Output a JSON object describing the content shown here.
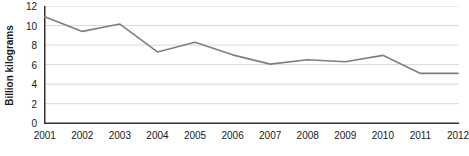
{
  "chart_data": {
    "type": "line",
    "title": "",
    "xlabel": "",
    "ylabel": "Billion kilograms",
    "categories": [
      "2001",
      "2002",
      "2003",
      "2004",
      "2005",
      "2006",
      "2007",
      "2008",
      "2009",
      "2010",
      "2011",
      "2012"
    ],
    "values": [
      10.9,
      9.4,
      10.15,
      7.3,
      8.3,
      7.0,
      6.05,
      6.5,
      6.3,
      6.95,
      5.1,
      5.1
    ],
    "series": [
      {
        "name": "Billion kilograms",
        "values": [
          10.9,
          9.4,
          10.15,
          7.3,
          8.3,
          7.0,
          6.05,
          6.5,
          6.3,
          6.95,
          5.1,
          5.1
        ]
      }
    ],
    "ylim": [
      0,
      12
    ],
    "ytick_labels": [
      "12",
      "10",
      "8",
      "6",
      "4",
      "2",
      "0"
    ],
    "ytick_values": [
      12,
      10,
      8,
      6,
      4,
      2,
      0
    ],
    "grid": true,
    "grid_axis": "y",
    "legend": "none",
    "markers": false,
    "line_color": "#7f7f7f",
    "grid_color": "#d9d9d9",
    "axis_color": "#333333",
    "background_color": "#ffffff",
    "text_color": "#1a1a1a"
  }
}
